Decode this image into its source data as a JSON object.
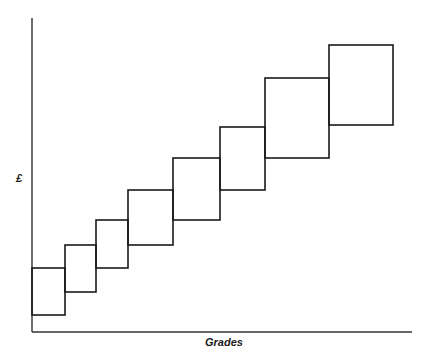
{
  "title": "",
  "axes": {
    "y_label": "£",
    "x_label": "Grades"
  },
  "chart_data": {
    "type": "diagram",
    "title": "",
    "xlabel": "Grades",
    "ylabel": "£",
    "bands": [
      {
        "grade": 1,
        "x": [
          32,
          65
        ],
        "y": [
          268,
          315
        ]
      },
      {
        "grade": 2,
        "x": [
          65,
          96
        ],
        "y": [
          245,
          292
        ]
      },
      {
        "grade": 3,
        "x": [
          96,
          128
        ],
        "y": [
          220,
          268
        ]
      },
      {
        "grade": 4,
        "x": [
          128,
          173
        ],
        "y": [
          190,
          245
        ]
      },
      {
        "grade": 5,
        "x": [
          173,
          220
        ],
        "y": [
          158,
          220
        ]
      },
      {
        "grade": 6,
        "x": [
          220,
          265
        ],
        "y": [
          127,
          190
        ]
      },
      {
        "grade": 7,
        "x": [
          265,
          329
        ],
        "y": [
          78,
          158
        ]
      },
      {
        "grade": 8,
        "x": [
          329,
          393
        ],
        "y": [
          45,
          125
        ]
      }
    ],
    "grid": false
  },
  "colors": {
    "line": "#1a1a1a",
    "background": "#ffffff"
  }
}
